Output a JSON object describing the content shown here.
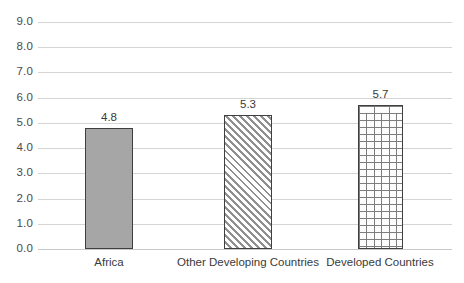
{
  "chart_data": {
    "type": "bar",
    "title": "",
    "subtitle": "",
    "xlabel": "",
    "ylabel": "",
    "categories": [
      "Africa",
      "Other Developing Countries",
      "Developed Countries"
    ],
    "values": [
      4.8,
      5.3,
      5.7
    ],
    "data_labels": [
      "4.8",
      "5.3",
      "5.7"
    ],
    "series": [
      {
        "name": "",
        "values": [
          4.8,
          5.3,
          5.7
        ]
      }
    ],
    "ylim": [
      0.0,
      9.0
    ],
    "ytick_labels": [
      "9.0",
      "8.0",
      "7.0",
      "6.0",
      "5.0",
      "4.0",
      "3.0",
      "2.0",
      "1.0",
      "0.0"
    ],
    "ytick_values": [
      9.0,
      8.0,
      7.0,
      6.0,
      5.0,
      4.0,
      3.0,
      2.0,
      1.0,
      0.0
    ],
    "grid": "horizontal",
    "legend": "none",
    "bar_fills": [
      "solid-gray",
      "diagonal-hatch",
      "brick-pattern"
    ],
    "colors": {
      "bar_solid_fill": "#A6A6A6",
      "bar_outline": "#3F3F3F",
      "gridline": "#D4D4D4",
      "text": "#3A3A3A",
      "background": "#FFFFFF"
    }
  }
}
